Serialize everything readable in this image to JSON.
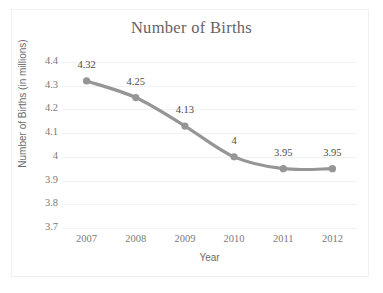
{
  "chart_data": {
    "type": "line",
    "title": "Number of Births",
    "xlabel": "Year",
    "ylabel": "Number of Births (in millions)",
    "categories": [
      "2007",
      "2008",
      "2009",
      "2010",
      "2011",
      "2012"
    ],
    "values": [
      4.32,
      4.25,
      4.13,
      4,
      3.95,
      3.95
    ],
    "point_labels": [
      "4.32",
      "4.25",
      "4.13",
      "4",
      "3.95",
      "3.95"
    ],
    "ylim": [
      3.7,
      4.4
    ],
    "yticks": [
      "4.4",
      "4.3",
      "4.2",
      "4.1",
      "4",
      "3.9",
      "3.8",
      "3.7"
    ],
    "ytick_values": [
      4.4,
      4.3,
      4.2,
      4.1,
      4.0,
      3.9,
      3.8,
      3.7
    ],
    "grid": true,
    "legend": false,
    "series_color": "#969696",
    "grid_color": "#f2f2f2",
    "text_color": "#7a7a7a",
    "title_color": "#646464",
    "smoothed": true
  }
}
